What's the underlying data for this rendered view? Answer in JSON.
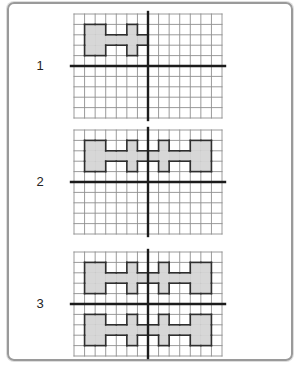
{
  "colors": {
    "frame": "#9a9a9a",
    "background": "#ffffff",
    "grid_line": "#8f8f8f",
    "axis": "#1c1c1c",
    "shape_fill": "#d7d7d7",
    "shape_outline": "#2e2e2e",
    "label_text": "#222222"
  },
  "panels": [
    {
      "label": "1",
      "grid": {
        "cols": 14,
        "rows": 10,
        "axis_col": 7,
        "axis_row": 5
      },
      "shape_cells": [
        [
          1,
          1
        ],
        [
          2,
          1
        ],
        [
          5,
          1
        ],
        [
          1,
          2
        ],
        [
          2,
          2
        ],
        [
          3,
          2
        ],
        [
          4,
          2
        ],
        [
          5,
          2
        ],
        [
          6,
          2
        ],
        [
          1,
          3
        ],
        [
          2,
          3
        ],
        [
          5,
          3
        ]
      ]
    },
    {
      "label": "2",
      "grid": {
        "cols": 14,
        "rows": 10,
        "axis_col": 7,
        "axis_row": 5
      },
      "shape_cells": [
        [
          1,
          1
        ],
        [
          2,
          1
        ],
        [
          5,
          1
        ],
        [
          8,
          1
        ],
        [
          11,
          1
        ],
        [
          12,
          1
        ],
        [
          1,
          2
        ],
        [
          2,
          2
        ],
        [
          3,
          2
        ],
        [
          4,
          2
        ],
        [
          5,
          2
        ],
        [
          6,
          2
        ],
        [
          7,
          2
        ],
        [
          8,
          2
        ],
        [
          9,
          2
        ],
        [
          10,
          2
        ],
        [
          11,
          2
        ],
        [
          12,
          2
        ],
        [
          1,
          3
        ],
        [
          2,
          3
        ],
        [
          5,
          3
        ],
        [
          8,
          3
        ],
        [
          11,
          3
        ],
        [
          12,
          3
        ]
      ]
    },
    {
      "label": "3",
      "grid": {
        "cols": 14,
        "rows": 10,
        "axis_col": 7,
        "axis_row": 5
      },
      "shape_cells": [
        [
          1,
          1
        ],
        [
          2,
          1
        ],
        [
          5,
          1
        ],
        [
          8,
          1
        ],
        [
          11,
          1
        ],
        [
          12,
          1
        ],
        [
          1,
          2
        ],
        [
          2,
          2
        ],
        [
          3,
          2
        ],
        [
          4,
          2
        ],
        [
          5,
          2
        ],
        [
          6,
          2
        ],
        [
          7,
          2
        ],
        [
          8,
          2
        ],
        [
          9,
          2
        ],
        [
          10,
          2
        ],
        [
          11,
          2
        ],
        [
          12,
          2
        ],
        [
          1,
          3
        ],
        [
          2,
          3
        ],
        [
          5,
          3
        ],
        [
          8,
          3
        ],
        [
          11,
          3
        ],
        [
          12,
          3
        ],
        [
          1,
          6
        ],
        [
          2,
          6
        ],
        [
          5,
          6
        ],
        [
          8,
          6
        ],
        [
          11,
          6
        ],
        [
          12,
          6
        ],
        [
          1,
          7
        ],
        [
          2,
          7
        ],
        [
          3,
          7
        ],
        [
          4,
          7
        ],
        [
          5,
          7
        ],
        [
          6,
          7
        ],
        [
          7,
          7
        ],
        [
          8,
          7
        ],
        [
          9,
          7
        ],
        [
          10,
          7
        ],
        [
          11,
          7
        ],
        [
          12,
          7
        ],
        [
          1,
          8
        ],
        [
          2,
          8
        ],
        [
          5,
          8
        ],
        [
          8,
          8
        ],
        [
          11,
          8
        ],
        [
          12,
          8
        ]
      ]
    }
  ]
}
